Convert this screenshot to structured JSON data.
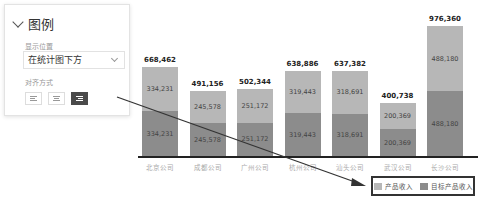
{
  "panel": {
    "title": "图例",
    "position_label": "显示位置",
    "position_value": "在统计图下方",
    "align_label": "对齐方式",
    "align_options": [
      "left",
      "center",
      "right"
    ],
    "align_selected": "right"
  },
  "chart_data": {
    "type": "bar",
    "stacked": true,
    "categories": [
      "北京公司",
      "成都公司",
      "广州公司",
      "杭州公司",
      "汕头公司",
      "武汉公司",
      "长沙公司"
    ],
    "series": [
      {
        "name": "目标产品收入",
        "color": "#8c8c8c",
        "values": [
          334231,
          245578,
          251172,
          319443,
          318691,
          200369,
          488180
        ]
      },
      {
        "name": "产品收入",
        "color": "#b7b7b7",
        "values": [
          334231,
          245578,
          251172,
          319443,
          318691,
          200369,
          488180
        ]
      }
    ],
    "totals": [
      668462,
      491156,
      502344,
      638886,
      637382,
      400738,
      976360
    ],
    "total_labels": [
      "668,462",
      "491,156",
      "502,344",
      "638,886",
      "637,382",
      "400,738",
      "976,360"
    ],
    "segment_labels": [
      "334,231",
      "245,578",
      "251,172",
      "319,443",
      "318,691",
      "200,369",
      "488,180"
    ],
    "legend": [
      "产品收入",
      "目标产品收入"
    ],
    "legend_position": "bottom-right",
    "grid": false
  }
}
